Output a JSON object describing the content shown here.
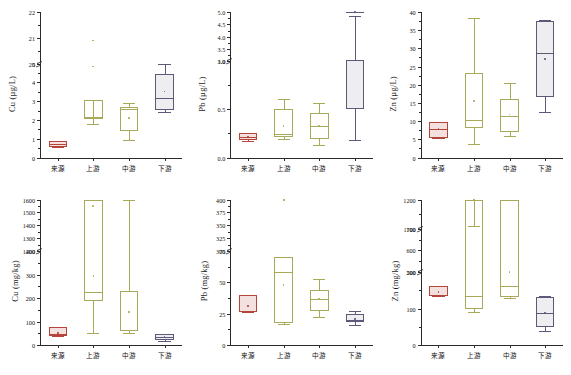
{
  "figure": {
    "title": "",
    "groups": [
      "来源",
      "上游",
      "中游",
      "下游"
    ],
    "group_colors": [
      "#b5443a",
      "#a8aa5a",
      "#a8aa5a",
      "#5c5a78"
    ],
    "panel_count": 6
  },
  "chart_data": [
    {
      "type": "box",
      "id": "cu-water",
      "title": "",
      "xlabel": "",
      "ylabel": "Cu (µg/L)",
      "ylabel_unit": "µg/L",
      "ylabel_analyte": "Cu",
      "categories": [
        "来源",
        "上游",
        "中游",
        "下游"
      ],
      "axis_break": true,
      "ticks_lower": [
        0,
        1,
        2,
        3,
        4,
        5
      ],
      "ticks_upper": [
        20,
        21,
        22
      ],
      "ylim_lower": [
        0,
        5
      ],
      "ylim_upper": [
        20,
        22
      ],
      "grid": false,
      "legend": "none",
      "boxes": [
        {
          "group": "来源",
          "min": 0.55,
          "q1": 0.58,
          "median": 0.7,
          "q3": 0.88,
          "max": 0.9,
          "mean": 0.7,
          "color": "#b5443a",
          "outliers": []
        },
        {
          "group": "上游",
          "min": 1.8,
          "q1": 2.1,
          "median": 2.12,
          "q3": 3.08,
          "max": 2.12,
          "mean": 2.55,
          "color": "#a8aa5a",
          "outliers": [
            20.9,
            4.85
          ]
        },
        {
          "group": "中游",
          "min": 0.95,
          "q1": 1.4,
          "median": 2.6,
          "q3": 2.68,
          "max": 2.9,
          "mean": 2.1,
          "color": "#a8aa5a",
          "outliers": []
        },
        {
          "group": "下游",
          "min": 2.4,
          "q1": 2.52,
          "median": 3.18,
          "q3": 4.45,
          "max": 5.0,
          "mean": 3.52,
          "color": "#5c5a78",
          "outliers": []
        }
      ]
    },
    {
      "type": "box",
      "id": "pb-water",
      "title": "",
      "xlabel": "",
      "ylabel": "Pb (µg/L)",
      "ylabel_unit": "µg/L",
      "ylabel_analyte": "Pb",
      "categories": [
        "来源",
        "上游",
        "中游",
        "下游"
      ],
      "axis_break": true,
      "ticks_lower": [
        0.0,
        0.5,
        1.0
      ],
      "ticks_upper": [
        3.0,
        3.5,
        4.0,
        4.5,
        5.0
      ],
      "ylim_lower": [
        0.0,
        1.0
      ],
      "ylim_upper": [
        3.0,
        5.0
      ],
      "grid": false,
      "legend": "none",
      "boxes": [
        {
          "group": "来源",
          "min": 0.17,
          "q1": 0.18,
          "median": 0.21,
          "q3": 0.26,
          "max": 0.26,
          "mean": 0.22,
          "color": "#b5443a",
          "outliers": []
        },
        {
          "group": "上游",
          "min": 0.19,
          "q1": 0.21,
          "median": 0.24,
          "q3": 0.51,
          "max": 0.61,
          "mean": 0.33,
          "color": "#a8aa5a",
          "outliers": []
        },
        {
          "group": "中游",
          "min": 0.13,
          "q1": 0.19,
          "median": 0.33,
          "q3": 0.46,
          "max": 0.57,
          "mean": 0.33,
          "color": "#a8aa5a",
          "outliers": []
        },
        {
          "group": "下游",
          "min": 0.18,
          "q1": 0.5,
          "median": 1.12,
          "q3": 3.05,
          "max": 4.85,
          "mean": 1.12,
          "color": "#5c5a78",
          "outliers": []
        }
      ]
    },
    {
      "type": "box",
      "id": "zn-water",
      "title": "",
      "xlabel": "",
      "ylabel": "Zn (µg/L)",
      "ylabel_unit": "µg/L",
      "ylabel_analyte": "Zn",
      "categories": [
        "来源",
        "上游",
        "中游",
        "下游"
      ],
      "axis_break": false,
      "ticks_lower": [
        0,
        5,
        10,
        15,
        20,
        25,
        30,
        35,
        40
      ],
      "ticks_upper": [],
      "ylim_lower": [
        0,
        40
      ],
      "ylim_upper": [],
      "grid": false,
      "legend": "none",
      "boxes": [
        {
          "group": "来源",
          "min": 5.3,
          "q1": 5.4,
          "median": 7.8,
          "q3": 9.7,
          "max": 9.8,
          "mean": 7.8,
          "color": "#b5443a",
          "outliers": []
        },
        {
          "group": "上游",
          "min": 3.8,
          "q1": 8.0,
          "median": 10.4,
          "q3": 23.1,
          "max": 38.3,
          "mean": 15.5,
          "color": "#a8aa5a",
          "outliers": []
        },
        {
          "group": "中游",
          "min": 5.8,
          "q1": 7.0,
          "median": 11.5,
          "q3": 16.2,
          "max": 20.6,
          "mean": 11.8,
          "color": "#a8aa5a",
          "outliers": []
        },
        {
          "group": "下游",
          "min": 12.6,
          "q1": 16.7,
          "median": 28.6,
          "q3": 37.4,
          "max": 37.8,
          "mean": 27.0,
          "color": "#5c5a78",
          "outliers": []
        }
      ]
    },
    {
      "type": "box",
      "id": "cu-sediment",
      "title": "",
      "xlabel": "",
      "ylabel": "Cu (mg/kg)",
      "ylabel_unit": "mg/kg",
      "ylabel_analyte": "Cu",
      "categories": [
        "来源",
        "上游",
        "中游",
        "下游"
      ],
      "axis_break": true,
      "ticks_lower": [
        0,
        100,
        200,
        300,
        400
      ],
      "ticks_upper": [
        1200,
        1300,
        1400,
        1500,
        1600
      ],
      "ylim_lower": [
        0,
        400
      ],
      "ylim_upper": [
        1200,
        1600
      ],
      "grid": false,
      "legend": "none",
      "boxes": [
        {
          "group": "来源",
          "min": 38,
          "q1": 40,
          "median": 45,
          "q3": 76,
          "max": 76,
          "mean": 50,
          "color": "#b5443a",
          "outliers": []
        },
        {
          "group": "上游",
          "min": 53,
          "q1": 188,
          "median": 225,
          "q3": 450,
          "max": 430,
          "mean": 295,
          "color": "#a8aa5a",
          "outliers": [
            1548
          ]
        },
        {
          "group": "中游",
          "min": 50,
          "q1": 58,
          "median": 65,
          "q3": 230,
          "max": 412,
          "mean": 140,
          "color": "#a8aa5a",
          "outliers": []
        },
        {
          "group": "下游",
          "min": 18,
          "q1": 22,
          "median": 33,
          "q3": 45,
          "max": 46,
          "mean": 33,
          "color": "#5c5a78",
          "outliers": []
        }
      ]
    },
    {
      "type": "box",
      "id": "pb-sediment",
      "title": "",
      "xlabel": "",
      "ylabel": "Pb (mg/kg)",
      "ylabel_unit": "mg/kg",
      "ylabel_analyte": "Pb",
      "categories": [
        "来源",
        "上游",
        "中游",
        "下游"
      ],
      "axis_break": true,
      "ticks_lower": [
        0,
        25,
        50,
        75
      ],
      "ticks_upper": [
        300,
        325,
        350,
        375,
        400
      ],
      "ylim_lower": [
        0,
        75
      ],
      "ylim_upper": [
        300,
        400
      ],
      "grid": false,
      "legend": "none",
      "boxes": [
        {
          "group": "来源",
          "min": 26,
          "q1": 26.5,
          "median": 27,
          "q3": 40,
          "max": 40,
          "mean": 31,
          "color": "#b5443a",
          "outliers": []
        },
        {
          "group": "上游",
          "min": 17,
          "q1": 17.5,
          "median": 58,
          "q3": 70,
          "max": 70,
          "mean": 48,
          "color": "#a8aa5a",
          "outliers": [
            398,
            120
          ]
        },
        {
          "group": "中游",
          "min": 22,
          "q1": 27,
          "median": 37,
          "q3": 44,
          "max": 53,
          "mean": 37,
          "color": "#a8aa5a",
          "outliers": []
        },
        {
          "group": "下游",
          "min": 16,
          "q1": 18,
          "median": 20,
          "q3": 25,
          "max": 27,
          "mean": 21,
          "color": "#5c5a78",
          "outliers": []
        }
      ]
    },
    {
      "type": "box",
      "id": "zn-sediment",
      "title": "",
      "xlabel": "",
      "ylabel": "Zn (mg/kg)",
      "ylabel_unit": "mg/kg",
      "ylabel_analyte": "Zn",
      "categories": [
        "来源",
        "上游",
        "中游",
        "下游"
      ],
      "axis_break": true,
      "ticks_lower": [
        0,
        100,
        200
      ],
      "ticks_mid": [
        500,
        600,
        700
      ],
      "ticks_upper": [
        1100,
        1200
      ],
      "ylim_lower": [
        0,
        200
      ],
      "ylim_mid": [
        500,
        700
      ],
      "ylim_upper": [
        1100,
        1200
      ],
      "grid": false,
      "legend": "none",
      "boxes": [
        {
          "group": "来源",
          "min": 134,
          "q1": 135,
          "median": 138,
          "q3": 162,
          "max": 162,
          "mean": 145,
          "color": "#b5443a",
          "outliers": []
        },
        {
          "group": "上游",
          "min": 92,
          "q1": 100,
          "median": 135,
          "q3": 900,
          "max": 1110,
          "mean": 340,
          "color": "#a8aa5a",
          "outliers": []
        },
        {
          "group": "中游",
          "min": 130,
          "q1": 133,
          "median": 163,
          "q3": 330,
          "max": 335,
          "mean": 200,
          "color": "#a8aa5a",
          "outliers": []
        },
        {
          "group": "下游",
          "min": 38,
          "q1": 50,
          "median": 88,
          "q3": 132,
          "max": 134,
          "mean": 88,
          "color": "#5c5a78",
          "outliers": []
        }
      ]
    }
  ]
}
